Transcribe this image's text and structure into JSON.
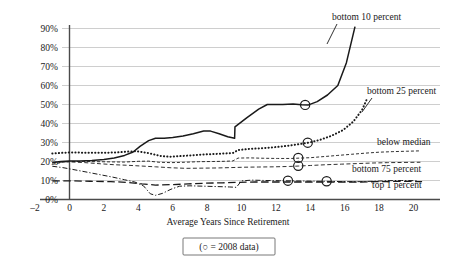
{
  "chart_data": {
    "type": "line",
    "title": "",
    "subtitle": "",
    "xlabel": "Average Years Since Retirement",
    "ylabel": "",
    "xlim": [
      -2.6,
      21.5
    ],
    "ylim": [
      0,
      95
    ],
    "grid": true,
    "grid_axis": "y",
    "legend_position": "inline-right-labels",
    "legend_note": "(○ = 2008 data)",
    "legend_note_symbol": "circle-outline",
    "xticks": [
      -2,
      0,
      2,
      4,
      6,
      8,
      10,
      12,
      14,
      16,
      18,
      20
    ],
    "xtick_labels": [
      "–2",
      "0",
      "2",
      "4",
      "6",
      "8",
      "10",
      "12",
      "14",
      "16",
      "18",
      "20"
    ],
    "yticks": [
      0,
      10,
      20,
      30,
      40,
      50,
      60,
      70,
      80,
      90
    ],
    "ytick_labels": [
      "0%",
      "10%",
      "20%",
      "30%",
      "40%",
      "50%",
      "60%",
      "70%",
      "80%",
      "90%"
    ],
    "series": [
      {
        "name": "bottom 10 percent",
        "label": "bottom 10 percent",
        "style": "solid",
        "color": "#1a1a1a",
        "width": 1.5,
        "points": [
          [
            -1.0,
            19.5
          ],
          [
            -0.5,
            20.0
          ],
          [
            0.0,
            20.2
          ],
          [
            0.6,
            20.2
          ],
          [
            1.3,
            20.5
          ],
          [
            2.0,
            21.0
          ],
          [
            2.6,
            21.8
          ],
          [
            3.2,
            23.2
          ],
          [
            3.7,
            25.0
          ],
          [
            4.1,
            28.0
          ],
          [
            4.6,
            31.0
          ],
          [
            5.0,
            32.2
          ],
          [
            5.5,
            32.2
          ],
          [
            6.0,
            32.6
          ],
          [
            6.6,
            33.4
          ],
          [
            7.2,
            34.6
          ],
          [
            7.8,
            36.0
          ],
          [
            8.2,
            36.0
          ],
          [
            8.7,
            34.6
          ],
          [
            9.2,
            33.0
          ],
          [
            9.6,
            32.2
          ],
          [
            9.62,
            38.2
          ],
          [
            10.3,
            43.0
          ],
          [
            11.0,
            47.6
          ],
          [
            11.5,
            50.0
          ],
          [
            12.4,
            50.0
          ],
          [
            13.0,
            50.2
          ],
          [
            13.5,
            49.9
          ],
          [
            13.9,
            49.8
          ],
          [
            14.4,
            51.5
          ],
          [
            15.0,
            55.0
          ],
          [
            15.6,
            60.0
          ],
          [
            16.1,
            72.0
          ],
          [
            16.6,
            91.0
          ]
        ],
        "markers_2008": [
          [
            13.7,
            49.8
          ]
        ]
      },
      {
        "name": "bottom 25 percent",
        "label": "bottom 25 percent",
        "style": "dotted",
        "color": "#1a1a1a",
        "width": 2.0,
        "points": [
          [
            -1.0,
            24.2
          ],
          [
            0.0,
            24.8
          ],
          [
            1.0,
            24.6
          ],
          [
            2.0,
            24.6
          ],
          [
            2.8,
            24.8
          ],
          [
            3.4,
            25.2
          ],
          [
            3.9,
            25.4
          ],
          [
            4.3,
            24.9
          ],
          [
            4.8,
            24.0
          ],
          [
            5.3,
            22.9
          ],
          [
            5.8,
            22.5
          ],
          [
            6.4,
            22.8
          ],
          [
            7.0,
            23.2
          ],
          [
            7.6,
            23.6
          ],
          [
            8.3,
            23.9
          ],
          [
            9.0,
            24.2
          ],
          [
            9.5,
            24.5
          ],
          [
            9.8,
            26.0
          ],
          [
            10.4,
            26.6
          ],
          [
            11.2,
            27.0
          ],
          [
            12.0,
            27.6
          ],
          [
            12.8,
            28.4
          ],
          [
            13.4,
            29.2
          ],
          [
            13.9,
            29.9
          ],
          [
            14.5,
            31.2
          ],
          [
            15.2,
            33.4
          ],
          [
            15.9,
            36.5
          ],
          [
            16.5,
            41.0
          ],
          [
            17.0,
            47.0
          ],
          [
            17.3,
            53.0
          ]
        ],
        "markers_2008": [
          [
            13.85,
            29.9
          ]
        ]
      },
      {
        "name": "below median",
        "label": "below median",
        "style": "dashed-fine",
        "color": "#1a1a1a",
        "width": 0.9,
        "points": [
          [
            -1.0,
            18.5
          ],
          [
            -0.4,
            19.6
          ],
          [
            0.0,
            20.0
          ],
          [
            0.8,
            20.0
          ],
          [
            1.6,
            19.9
          ],
          [
            2.4,
            19.8
          ],
          [
            3.2,
            19.7
          ],
          [
            4.0,
            20.1
          ],
          [
            4.6,
            20.2
          ],
          [
            5.2,
            19.6
          ],
          [
            5.9,
            19.4
          ],
          [
            6.7,
            19.6
          ],
          [
            7.5,
            19.9
          ],
          [
            8.3,
            20.0
          ],
          [
            9.0,
            20.1
          ],
          [
            9.5,
            20.3
          ],
          [
            9.8,
            21.8
          ],
          [
            10.5,
            21.9
          ],
          [
            11.3,
            21.7
          ],
          [
            12.1,
            21.6
          ],
          [
            12.9,
            21.6
          ],
          [
            13.4,
            21.8
          ],
          [
            14.0,
            22.0
          ],
          [
            14.8,
            22.6
          ],
          [
            15.6,
            23.2
          ],
          [
            16.4,
            23.8
          ],
          [
            17.2,
            24.4
          ],
          [
            18.0,
            24.9
          ],
          [
            18.8,
            25.2
          ],
          [
            19.6,
            25.4
          ],
          [
            20.4,
            25.6
          ]
        ],
        "markers_2008": [
          [
            13.3,
            21.9
          ]
        ]
      },
      {
        "name": "bottom 75 percent",
        "label": "bottom 75 percent",
        "style": "dashed-light",
        "color": "#8a8a8a",
        "width": 0.9,
        "points": [
          [
            -1.0,
            19.4
          ],
          [
            -0.3,
            19.8
          ],
          [
            0.0,
            19.8
          ],
          [
            0.9,
            19.4
          ],
          [
            1.8,
            18.8
          ],
          [
            2.6,
            18.3
          ],
          [
            3.4,
            18.0
          ],
          [
            4.2,
            17.6
          ],
          [
            5.0,
            17.2
          ],
          [
            5.9,
            16.7
          ],
          [
            6.8,
            16.4
          ],
          [
            7.7,
            16.5
          ],
          [
            8.6,
            16.6
          ],
          [
            9.4,
            16.8
          ],
          [
            10.2,
            17.0
          ],
          [
            11.0,
            17.1
          ],
          [
            11.9,
            17.2
          ],
          [
            12.8,
            17.4
          ],
          [
            13.3,
            17.6
          ],
          [
            14.0,
            17.9
          ],
          [
            14.9,
            18.3
          ],
          [
            15.8,
            18.6
          ],
          [
            16.7,
            18.9
          ],
          [
            17.6,
            19.2
          ],
          [
            18.5,
            19.4
          ],
          [
            19.4,
            19.5
          ],
          [
            20.4,
            19.6
          ]
        ],
        "markers_2008": [
          [
            13.3,
            17.7
          ]
        ]
      },
      {
        "name": "top 1 percent",
        "label": "top 1 percent",
        "style": "dash-dot",
        "color": "#1a1a1a",
        "width": 1.0,
        "points": [
          [
            -1.0,
            17.5
          ],
          [
            -0.4,
            16.8
          ],
          [
            0.2,
            15.8
          ],
          [
            0.9,
            14.6
          ],
          [
            1.7,
            13.2
          ],
          [
            2.5,
            11.8
          ],
          [
            3.2,
            10.4
          ],
          [
            3.8,
            9.2
          ],
          [
            4.3,
            7.2
          ],
          [
            4.7,
            3.0
          ],
          [
            5.0,
            2.2
          ],
          [
            5.4,
            3.2
          ],
          [
            5.9,
            5.4
          ],
          [
            6.4,
            7.0
          ],
          [
            7.0,
            7.2
          ],
          [
            7.8,
            7.0
          ],
          [
            8.6,
            6.8
          ],
          [
            9.3,
            6.6
          ],
          [
            9.7,
            6.4
          ],
          [
            10.0,
            9.8
          ],
          [
            10.6,
            10.2
          ],
          [
            11.4,
            10.0
          ],
          [
            12.2,
            9.9
          ],
          [
            13.0,
            9.8
          ],
          [
            13.8,
            9.7
          ],
          [
            14.6,
            9.6
          ],
          [
            15.3,
            9.5
          ],
          [
            16.1,
            9.4
          ],
          [
            16.9,
            9.4
          ],
          [
            17.7,
            9.6
          ],
          [
            18.5,
            9.9
          ],
          [
            19.3,
            10.0
          ],
          [
            20.2,
            9.9
          ]
        ],
        "markers_2008": [
          [
            12.7,
            9.9
          ],
          [
            14.95,
            9.6
          ]
        ]
      },
      {
        "name": "long-dash baseline series",
        "label": "",
        "style": "long-dash",
        "color": "#1a1a1a",
        "width": 1.3,
        "points": [
          [
            -1.0,
            9.8
          ],
          [
            0.0,
            9.8
          ],
          [
            1.2,
            9.6
          ],
          [
            2.4,
            9.4
          ],
          [
            3.4,
            9.0
          ],
          [
            4.2,
            8.2
          ],
          [
            5.0,
            7.6
          ],
          [
            5.9,
            7.8
          ],
          [
            6.9,
            8.2
          ],
          [
            7.9,
            8.6
          ],
          [
            8.9,
            8.8
          ],
          [
            9.8,
            9.0
          ],
          [
            10.8,
            9.2
          ],
          [
            11.8,
            9.2
          ],
          [
            12.8,
            9.2
          ],
          [
            13.8,
            9.2
          ],
          [
            14.8,
            9.2
          ],
          [
            15.8,
            9.2
          ],
          [
            16.8,
            9.2
          ],
          [
            17.8,
            9.4
          ],
          [
            18.8,
            9.5
          ],
          [
            19.8,
            9.5
          ],
          [
            20.5,
            9.4
          ]
        ],
        "markers_2008": []
      }
    ],
    "annotations": [
      {
        "text": "bottom 10 percent",
        "x_px": 332,
        "y_px": 20,
        "anchor": "start"
      },
      {
        "text": "bottom 25 percent",
        "x_px": 367,
        "y_px": 94,
        "anchor": "start"
      },
      {
        "text": "below median",
        "x_px": 377,
        "y_px": 145,
        "anchor": "start"
      },
      {
        "text": "bottom 75 percent",
        "x_px": 352,
        "y_px": 172,
        "anchor": "start"
      },
      {
        "text": "top 1 percent",
        "x_px": 372,
        "y_px": 188,
        "anchor": "start"
      }
    ]
  }
}
